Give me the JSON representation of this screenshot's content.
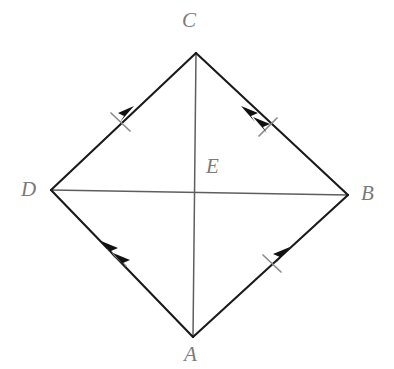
{
  "figure": {
    "kind": "euclidean-geometry-diagram",
    "shape_name": "quadrilateral-with-diagonals",
    "background_color": "#ffffff",
    "side_color": "#1a1a1a",
    "diagonal_color": "#5e5e5e",
    "tick_color": "#8c8c8c",
    "label_color": "#7b7b7b"
  },
  "labels": {
    "a": "A",
    "b": "B",
    "c": "C",
    "d": "D",
    "e": "E"
  },
  "vertices": [
    {
      "name": "C",
      "x": 196,
      "y": 53
    },
    {
      "name": "D",
      "x": 51,
      "y": 190
    },
    {
      "name": "B",
      "x": 348,
      "y": 195
    },
    {
      "name": "A",
      "x": 193,
      "y": 337
    },
    {
      "name": "E",
      "x": 196,
      "y": 193
    }
  ],
  "sides": [
    {
      "name": "DC",
      "from": "D",
      "to": "C",
      "x1": 51,
      "y1": 190,
      "x2": 196,
      "y2": 53,
      "arrow_count": 1,
      "arrow_direction": "toward-C",
      "tick_count": 1
    },
    {
      "name": "BC",
      "from": "B",
      "to": "C",
      "x1": 348,
      "y1": 195,
      "x2": 196,
      "y2": 53,
      "arrow_count": 2,
      "arrow_direction": "toward-C",
      "tick_count": 1
    },
    {
      "name": "AD",
      "from": "A",
      "to": "D",
      "x1": 193,
      "y1": 337,
      "x2": 51,
      "y2": 190,
      "arrow_count": 2,
      "arrow_direction": "toward-D",
      "tick_count": 1
    },
    {
      "name": "AB",
      "from": "A",
      "to": "B",
      "x1": 193,
      "y1": 337,
      "x2": 348,
      "y2": 195,
      "arrow_count": 1,
      "arrow_direction": "toward-B",
      "tick_count": 1
    }
  ],
  "diagonals": [
    {
      "name": "DB",
      "from": "D",
      "to": "B",
      "x1": 51,
      "y1": 190,
      "x2": 348,
      "y2": 195,
      "arrow_count": 0,
      "tick_count": 0
    },
    {
      "name": "CA",
      "from": "C",
      "to": "A",
      "x1": 196,
      "y1": 53,
      "x2": 193,
      "y2": 337,
      "arrow_count": 0,
      "tick_count": 0
    }
  ],
  "annotations": {
    "intersection_point": "E",
    "parallel_pair_single_arrow": [
      "DC",
      "AB"
    ],
    "parallel_pair_double_arrow": [
      "AD",
      "BC"
    ],
    "congruent_sides_tick_marks": [
      "DC",
      "BC",
      "AD",
      "AB"
    ]
  }
}
